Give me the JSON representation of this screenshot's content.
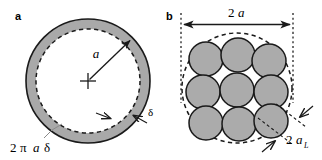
{
  "figure": {
    "width": 322,
    "height": 160,
    "background_color": "#ffffff"
  },
  "colors": {
    "gray_fill": "#a9a9a9",
    "gray_fill_circles": "#ababab",
    "stroke": "#1a1a1a",
    "dashed_stroke": "#1a1a1a",
    "dotted_guide": "#1a1a1a",
    "leader_line": "#808080",
    "background": "#ffffff"
  },
  "panel_a": {
    "letter": "a",
    "radius_label": "a",
    "thickness_label": "δ",
    "area_label_parts": {
      "coefficient": "2",
      "pi": "π",
      "radius": "a",
      "delta": "δ"
    },
    "area_label_full": "2πaδ",
    "center_marker": "plus-cross",
    "geometry": {
      "center_x": 88,
      "center_y": 81,
      "outer_radius": 62,
      "inner_radius": 52,
      "outer_circle_style": "solid",
      "inner_circle_style": "dashed"
    },
    "annotations": [
      {
        "name": "radius-arrow",
        "from": "center",
        "to": "outer-upper-right",
        "label": "a"
      },
      {
        "name": "thickness-arrows",
        "count": 2,
        "label": "δ",
        "points_to": "annular-band"
      },
      {
        "name": "area-leader",
        "label": "2πaδ",
        "points_to": "annular-band-lower-left"
      }
    ]
  },
  "panel_b": {
    "letter": "b",
    "diameter_label_parts": {
      "coefficient": "2",
      "radius": "a"
    },
    "diameter_label_full": "2a",
    "filament_label_parts": {
      "coefficient": "2",
      "radius": "a",
      "subscript": "L"
    },
    "filament_label_full": "2a_L",
    "geometry": {
      "center_x": 237,
      "center_y": 88,
      "envelope_radius": 55,
      "envelope_style": "dashed",
      "filament_count": 9,
      "filament_radius": 17,
      "arrangement": "3 rows of 3, hexagonal-like packing"
    },
    "filaments": [
      {
        "index": 1,
        "cx": 206,
        "cy": 59
      },
      {
        "index": 2,
        "cx": 238,
        "cy": 55
      },
      {
        "index": 3,
        "cx": 269,
        "cy": 61
      },
      {
        "index": 4,
        "cx": 203,
        "cy": 92
      },
      {
        "index": 5,
        "cx": 237,
        "cy": 90
      },
      {
        "index": 6,
        "cx": 271,
        "cy": 92
      },
      {
        "index": 7,
        "cx": 206,
        "cy": 123
      },
      {
        "index": 8,
        "cx": 239,
        "cy": 124
      },
      {
        "index": 9,
        "cx": 271,
        "cy": 121
      }
    ],
    "annotations": [
      {
        "name": "diameter-dimension-arrow",
        "label": "2a",
        "style": "double-headed horizontal arrow between vertical dotted guides"
      },
      {
        "name": "filament-diameter-arrows",
        "count": 2,
        "label": "2a_L",
        "points_to": "single-filament-diameter"
      }
    ]
  }
}
